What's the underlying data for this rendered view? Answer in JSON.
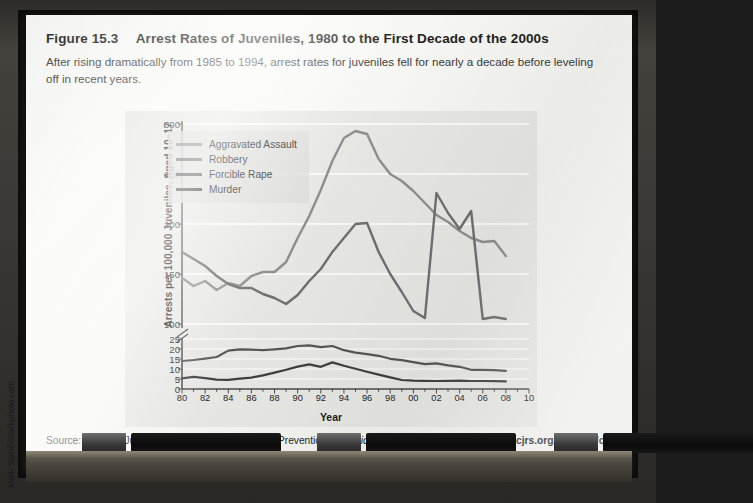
{
  "figure": {
    "label": "Figure 15.3",
    "title": "Arrest Rates of Juveniles, 1980 to the First Decade of the 2000s",
    "subtitle": "After rising dramatically from 1985 to 1994, arrest rates for juveniles fell for nearly a decade before leveling off in recent years."
  },
  "source": {
    "prefix": "Source: Office of Juvenile Justice and Delinquency Prevention,",
    "publication": "Statistical Briefing Book,",
    "at": "at",
    "url": "www.ojjdp.ncjrs.org/ojstatbb/crime/JAR.asp",
    "period": "."
  },
  "credit": "Mark Stahl/iStockphoto.com",
  "tray": {
    "items": [
      {
        "name": "eraser",
        "type": "eraser",
        "left": 82,
        "width": 44
      },
      {
        "name": "marker-black-1",
        "type": "dark",
        "left": 131,
        "width": 150
      },
      {
        "name": "eraser-2",
        "type": "eraser",
        "left": 317,
        "width": 44
      },
      {
        "name": "marker-black-2",
        "type": "dark",
        "left": 366,
        "width": 150
      },
      {
        "name": "eraser-3",
        "type": "eraser",
        "left": 554,
        "width": 44
      },
      {
        "name": "marker-black-3",
        "type": "dark",
        "left": 603,
        "width": 150
      }
    ]
  },
  "chart_data": {
    "type": "line",
    "title": "Arrest Rates of Juveniles, 1980 to the First Decade of the 2000s",
    "xlabel": "Year",
    "ylabel": "Arrests per 100,000 Juveniles, Aged 10–17",
    "grid": true,
    "legend_position": "upper-left",
    "broken_axis": true,
    "axis_note": "y axis is broken between 25 and 100",
    "xlim": [
      1980,
      2010
    ],
    "x_tick_labels": [
      "80",
      "82",
      "84",
      "86",
      "88",
      "90",
      "92",
      "94",
      "96",
      "98",
      "00",
      "02",
      "04",
      "06",
      "08",
      "10"
    ],
    "x_tick_values": [
      1980,
      1982,
      1984,
      1986,
      1988,
      1990,
      1992,
      1994,
      1996,
      1998,
      2000,
      2002,
      2004,
      2006,
      2008,
      2010
    ],
    "y_ticks_lower": [
      0,
      5,
      10,
      15,
      20,
      25
    ],
    "y_ticks_upper": [
      100,
      150,
      200,
      250,
      300
    ],
    "x": [
      1980,
      1981,
      1982,
      1983,
      1984,
      1985,
      1986,
      1987,
      1988,
      1989,
      1990,
      1991,
      1992,
      1993,
      1994,
      1995,
      1996,
      1997,
      1998,
      1999,
      2000,
      2001,
      2002,
      2003,
      2004,
      2005,
      2006,
      2007,
      2008
    ],
    "series": [
      {
        "name": "Aggravated Assault",
        "color": "#8e8e8e",
        "values": [
          146,
          138,
          143,
          134,
          141,
          138,
          148,
          152,
          152,
          162,
          186,
          208,
          234,
          263,
          286,
          293,
          290,
          265,
          250,
          243,
          233,
          221,
          209,
          202,
          193,
          186,
          182,
          183,
          168
        ]
      },
      {
        "name": "Robbery",
        "color": "#6f6f6f",
        "values": [
          172,
          165,
          158,
          148,
          140,
          136,
          136,
          130,
          126,
          120,
          129,
          143,
          155,
          172,
          186,
          200,
          201,
          172,
          150,
          132,
          113,
          106,
          98,
          88,
          80,
          89,
          105,
          107,
          105
        ]
      },
      {
        "name": "Forcible Rape",
        "color": "#555555",
        "values": [
          14,
          14.5,
          15.2,
          16,
          19.2,
          19.8,
          19.7,
          19.4,
          19.8,
          20.3,
          21.5,
          21.8,
          20.9,
          21.5,
          19.4,
          18.2,
          17.4,
          16.6,
          15.1,
          14.4,
          13.4,
          12.4,
          12.8,
          11.8,
          11.1,
          9.6,
          9.6,
          9.4,
          9.1
        ]
      },
      {
        "name": "Murder",
        "color": "#3f3f3f",
        "values": [
          5.3,
          6.1,
          5.4,
          4.7,
          4.6,
          5.2,
          5.7,
          6.8,
          8.2,
          9.6,
          11.2,
          12.3,
          11.1,
          13.3,
          11.6,
          10.1,
          8.6,
          7.2,
          5.8,
          4.5,
          4.2,
          4.1,
          4.0,
          4.1,
          4.2,
          4.0,
          4.0,
          3.9,
          3.8
        ]
      }
    ],
    "peak_annotations": [
      {
        "series": "Aggravated Assault",
        "year": 1995,
        "value": 293
      },
      {
        "series": "Robbery",
        "year": 1996,
        "value": 201
      },
      {
        "series": "Forcible Rape",
        "year": 1991,
        "value": 21.8
      },
      {
        "series": "Murder",
        "year": 1993,
        "value": 13.3
      }
    ]
  }
}
